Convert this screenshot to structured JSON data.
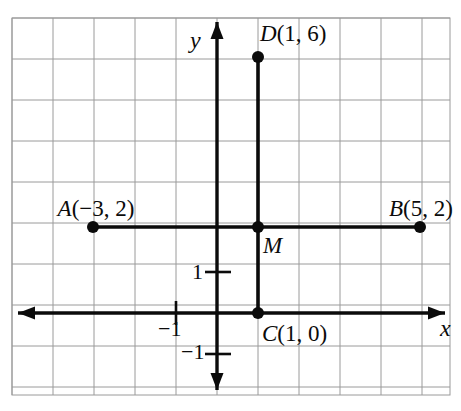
{
  "figure": {
    "kind": "coordinate-plane-diagram",
    "background_color": "#ffffff",
    "ink_color": "#0b0b0b",
    "grid": {
      "line_color": "#9a9a9a",
      "line_width": 1,
      "cell_size_px": 41,
      "left_px": 12,
      "top_px": 18,
      "right_px": 450,
      "bottom_px": 395,
      "columns": 11,
      "rows": 9,
      "show_border": true
    },
    "axes": {
      "x_axis": {
        "label": "x",
        "label_x": 440,
        "label_y": 316,
        "y_px": 313,
        "x_start_px": 18,
        "x_end_px": 445,
        "arrow_start": true,
        "arrow_end": true,
        "stroke_width": 3.4
      },
      "y_axis": {
        "label": "y",
        "label_x": 190,
        "label_y": 28,
        "x_px": 217,
        "y_start_px": 22,
        "y_end_px": 390,
        "arrow_start": true,
        "arrow_end": true,
        "stroke_width": 3.4
      },
      "origin_px": {
        "x": 217,
        "y": 313
      },
      "unit_px": 41
    },
    "ticks": [
      {
        "name": "y-tick-1",
        "label": "1",
        "axis": "y",
        "value": 1,
        "tick_x1": 205,
        "tick_x2": 231,
        "tick_y": 272,
        "label_x": 192,
        "label_y": 261
      },
      {
        "name": "y-tick-minus1",
        "label": "−1",
        "axis": "y",
        "value": -1,
        "tick_x1": 205,
        "tick_x2": 231,
        "tick_y": 354,
        "label_x": 181,
        "label_y": 341
      },
      {
        "name": "x-tick-minus1",
        "label": "−1",
        "axis": "x",
        "value": -1,
        "tick_x1": 176,
        "tick_x2": 176,
        "tick_y1": 301,
        "tick_y2": 325,
        "label_x": 158,
        "label_y": 318
      }
    ],
    "segments": [
      {
        "name": "segment-ab",
        "from": "A",
        "to": "B",
        "x1_px": 93,
        "y1_px": 227,
        "x2_px": 420,
        "y2_px": 227,
        "stroke_width": 3.6
      },
      {
        "name": "segment-cd",
        "from": "C",
        "to": "D",
        "x1_px": 258,
        "y1_px": 57,
        "x2_px": 258,
        "y2_px": 313,
        "stroke_width": 3.6
      }
    ],
    "points": [
      {
        "name": "point-a",
        "label": "A",
        "coords_text": "(−3, 2)",
        "full_label": "A(−3, 2)",
        "x": -3,
        "y": 2,
        "px": 93,
        "py": 227,
        "radius": 6,
        "label_x": 96,
        "label_y": 197,
        "label_anchor": "middle"
      },
      {
        "name": "point-b",
        "label": "B",
        "coords_text": "(5, 2)",
        "full_label": "B(5, 2)",
        "x": 5,
        "y": 2,
        "px": 420,
        "py": 227,
        "radius": 6,
        "label_x": 421,
        "label_y": 197,
        "label_anchor": "middle"
      },
      {
        "name": "point-c",
        "label": "C",
        "coords_text": "(1, 0)",
        "full_label": "C(1, 0)",
        "x": 1,
        "y": 0,
        "px": 258,
        "py": 313,
        "radius": 6,
        "label_x": 262,
        "label_y": 322,
        "label_anchor": "start"
      },
      {
        "name": "point-d",
        "label": "D",
        "coords_text": "(1, 6)",
        "full_label": "D(1, 6)",
        "x": 1,
        "y": 6,
        "px": 258,
        "py": 57,
        "radius": 6,
        "label_x": 260,
        "label_y": 22,
        "label_anchor": "start"
      },
      {
        "name": "point-m",
        "label": "M",
        "coords_text": "",
        "full_label": "M",
        "x": 1,
        "y": 2,
        "px": 258,
        "py": 227,
        "radius": 6,
        "label_x": 263,
        "label_y": 234,
        "label_anchor": "start"
      }
    ]
  },
  "chart_data": {
    "type": "scatter",
    "xlabel": "x",
    "ylabel": "y",
    "xlim": [
      -5,
      6
    ],
    "ylim": [
      -2,
      7
    ],
    "grid": true,
    "legend": "none",
    "unit_step": 1,
    "x_tick_labels": [
      "−1"
    ],
    "y_tick_labels": [
      "1",
      "−1"
    ],
    "points": [
      {
        "label": "A(−3, 2)",
        "x": -3,
        "y": 2
      },
      {
        "label": "B(5, 2)",
        "x": 5,
        "y": 2
      },
      {
        "label": "C(1, 0)",
        "x": 1,
        "y": 0
      },
      {
        "label": "D(1, 6)",
        "x": 1,
        "y": 6
      },
      {
        "label": "M",
        "x": 1,
        "y": 2
      }
    ],
    "series": [
      {
        "name": "AB",
        "x": [
          -3,
          5
        ],
        "values": [
          2,
          2
        ]
      },
      {
        "name": "CD",
        "x": [
          1,
          1
        ],
        "values": [
          0,
          6
        ]
      }
    ],
    "annotations": [
      "A(−3, 2)",
      "B(5, 2)",
      "C(1, 0)",
      "D(1, 6)",
      "M",
      "x",
      "y",
      "1",
      "−1",
      "−1"
    ]
  }
}
